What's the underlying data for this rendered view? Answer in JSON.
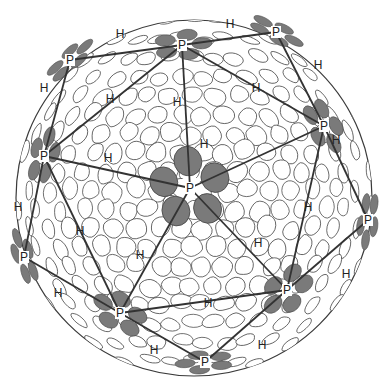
{
  "figure": {
    "colors": {
      "background": "#ffffff",
      "capsomer_fill": "#ffffff",
      "capsomer_stroke": "#3a3a3a",
      "pentamer_subunit": "#7a7a7a",
      "lattice_line": "#333333",
      "label": "#222222"
    },
    "sphere": {
      "cx": 194,
      "cy": 198,
      "r": 178
    },
    "labels": {
      "pentamer": "P",
      "hexamer": "H"
    },
    "pentamers": [
      {
        "id": "center",
        "x": 190,
        "y": 188
      },
      {
        "id": "top",
        "x": 182,
        "y": 45
      },
      {
        "id": "upper-left-edge",
        "x": 70,
        "y": 60
      },
      {
        "id": "top-right-edge",
        "x": 276,
        "y": 32
      },
      {
        "id": "right",
        "x": 324,
        "y": 126
      },
      {
        "id": "left",
        "x": 44,
        "y": 156
      },
      {
        "id": "right-edge",
        "x": 368,
        "y": 220
      },
      {
        "id": "lower-left-edge",
        "x": 24,
        "y": 257
      },
      {
        "id": "lower-left",
        "x": 120,
        "y": 313
      },
      {
        "id": "lower-right",
        "x": 287,
        "y": 290
      },
      {
        "id": "bottom",
        "x": 205,
        "y": 362
      }
    ],
    "hexamers": [
      {
        "x": 120,
        "y": 34
      },
      {
        "x": 230,
        "y": 24
      },
      {
        "x": 318,
        "y": 65
      },
      {
        "x": 256,
        "y": 88
      },
      {
        "x": 110,
        "y": 99
      },
      {
        "x": 44,
        "y": 88
      },
      {
        "x": 177,
        "y": 102
      },
      {
        "x": 108,
        "y": 158
      },
      {
        "x": 204,
        "y": 144
      },
      {
        "x": 336,
        "y": 140
      },
      {
        "x": 18,
        "y": 207
      },
      {
        "x": 80,
        "y": 231
      },
      {
        "x": 140,
        "y": 255
      },
      {
        "x": 308,
        "y": 207
      },
      {
        "x": 258,
        "y": 243
      },
      {
        "x": 346,
        "y": 274
      },
      {
        "x": 58,
        "y": 293
      },
      {
        "x": 208,
        "y": 303
      },
      {
        "x": 154,
        "y": 350
      },
      {
        "x": 262,
        "y": 345
      }
    ],
    "lattice_edges": [
      [
        "center",
        "top"
      ],
      [
        "center",
        "left"
      ],
      [
        "center",
        "right"
      ],
      [
        "center",
        "lower-left"
      ],
      [
        "center",
        "lower-right"
      ],
      [
        "top",
        "upper-left-edge"
      ],
      [
        "top",
        "top-right-edge"
      ],
      [
        "top",
        "right"
      ],
      [
        "top",
        "left"
      ],
      [
        "upper-left-edge",
        "left"
      ],
      [
        "top-right-edge",
        "right"
      ],
      [
        "right",
        "right-edge"
      ],
      [
        "right",
        "lower-right"
      ],
      [
        "right-edge",
        "lower-right"
      ],
      [
        "left",
        "lower-left-edge"
      ],
      [
        "left",
        "lower-left"
      ],
      [
        "lower-left-edge",
        "lower-left"
      ],
      [
        "lower-left",
        "lower-right"
      ],
      [
        "lower-left",
        "bottom"
      ],
      [
        "lower-right",
        "bottom"
      ]
    ]
  }
}
